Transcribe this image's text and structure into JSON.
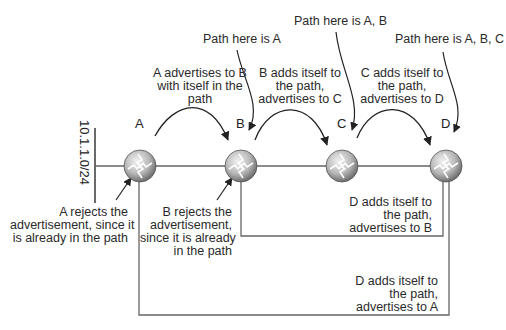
{
  "diagram": {
    "network": "10.1.1.0/24",
    "routers": [
      {
        "id": "A",
        "label": "A"
      },
      {
        "id": "B",
        "label": "B"
      },
      {
        "id": "C",
        "label": "C"
      },
      {
        "id": "D",
        "label": "D"
      }
    ],
    "path_notes": {
      "at_b": "Path here is A",
      "at_c": "Path here is A, B",
      "at_d": "Path here is A, B, C"
    },
    "advertise_notes": {
      "a_to_b": "A advertises to B\nwith itself in the\npath",
      "b_to_c": "B adds itself to\nthe path,\nadvertises to C",
      "c_to_d": "C adds itself to\nthe path,\nadvertises to D",
      "d_to_b": "D adds itself to\nthe path,\nadvertises to B",
      "d_to_a": "D adds itself to\nthe path,\nadvertises to A"
    },
    "reject_notes": {
      "a": "A rejects the\nadvertisement, since it\nis already in the path",
      "b": "B rejects the\nadvertisement,\nsince it is already\nin the path"
    },
    "colors": {
      "line": "#555555",
      "router_light": "#e6e6e6",
      "router_dark": "#7a7a7a"
    }
  }
}
